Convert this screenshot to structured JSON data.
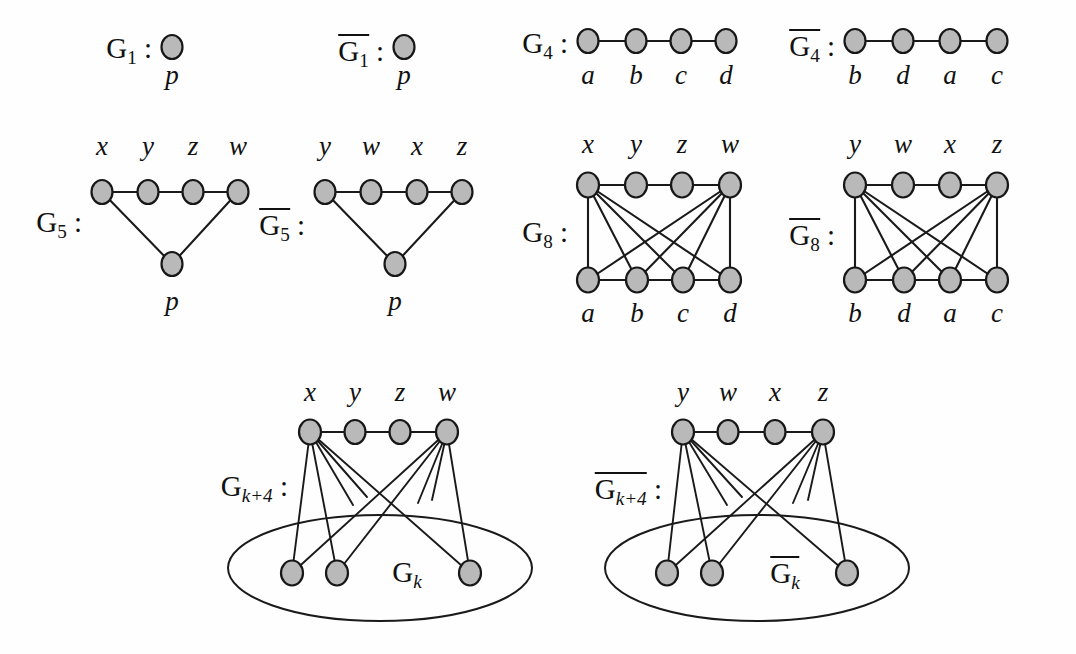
{
  "figure": {
    "background_color": "#fefefe",
    "node_fill": "#b9b9b9",
    "node_stroke": "#171717",
    "edge_color": "#1a1a1a"
  },
  "panels": {
    "g1": {
      "name": "G",
      "subscript": "1",
      "colon": ":",
      "overline": false,
      "vertices": [
        {
          "id": "p",
          "label": "p"
        }
      ]
    },
    "g1_bar": {
      "name": "G",
      "subscript": "1",
      "colon": ":",
      "overline": true,
      "vertices": [
        {
          "id": "p",
          "label": "p"
        }
      ]
    },
    "g4": {
      "name": "G",
      "subscript": "4",
      "colon": ":",
      "overline": false,
      "vertices": [
        {
          "id": "a",
          "label": "a"
        },
        {
          "id": "b",
          "label": "b"
        },
        {
          "id": "c",
          "label": "c"
        },
        {
          "id": "d",
          "label": "d"
        }
      ],
      "edges": [
        [
          "a",
          "b"
        ],
        [
          "b",
          "c"
        ],
        [
          "c",
          "d"
        ]
      ]
    },
    "g4_bar": {
      "name": "G",
      "subscript": "4",
      "colon": ":",
      "overline": true,
      "vertices": [
        {
          "id": "b",
          "label": "b"
        },
        {
          "id": "d",
          "label": "d"
        },
        {
          "id": "a",
          "label": "a"
        },
        {
          "id": "c",
          "label": "c"
        }
      ],
      "edges": [
        [
          "b",
          "d"
        ],
        [
          "d",
          "a"
        ],
        [
          "a",
          "c"
        ]
      ]
    },
    "g5": {
      "name": "G",
      "subscript": "5",
      "colon": ":",
      "overline": false,
      "top_vertices": [
        {
          "id": "x",
          "label": "x"
        },
        {
          "id": "y",
          "label": "y"
        },
        {
          "id": "z",
          "label": "z"
        },
        {
          "id": "w",
          "label": "w"
        }
      ],
      "apex": {
        "id": "p",
        "label": "p"
      },
      "edges": [
        [
          "x",
          "y"
        ],
        [
          "y",
          "z"
        ],
        [
          "z",
          "w"
        ],
        [
          "x",
          "p"
        ],
        [
          "w",
          "p"
        ]
      ]
    },
    "g5_bar": {
      "name": "G",
      "subscript": "5",
      "colon": ":",
      "overline": true,
      "top_vertices": [
        {
          "id": "y",
          "label": "y"
        },
        {
          "id": "w",
          "label": "w"
        },
        {
          "id": "x",
          "label": "x"
        },
        {
          "id": "z",
          "label": "z"
        }
      ],
      "apex": {
        "id": "p",
        "label": "p"
      },
      "edges": [
        [
          "y",
          "w"
        ],
        [
          "w",
          "x"
        ],
        [
          "x",
          "z"
        ],
        [
          "y",
          "p"
        ],
        [
          "z",
          "p"
        ]
      ]
    },
    "g8": {
      "name": "G",
      "subscript": "8",
      "colon": ":",
      "overline": false,
      "top_vertices": [
        {
          "id": "x",
          "label": "x"
        },
        {
          "id": "y",
          "label": "y"
        },
        {
          "id": "z",
          "label": "z"
        },
        {
          "id": "w",
          "label": "w"
        }
      ],
      "bottom_vertices": [
        {
          "id": "a",
          "label": "a"
        },
        {
          "id": "b",
          "label": "b"
        },
        {
          "id": "c",
          "label": "c"
        },
        {
          "id": "d",
          "label": "d"
        }
      ],
      "top_edges": [
        [
          "x",
          "y"
        ],
        [
          "y",
          "z"
        ],
        [
          "z",
          "w"
        ]
      ],
      "bottom_edges": [
        [
          "a",
          "b"
        ],
        [
          "b",
          "c"
        ],
        [
          "c",
          "d"
        ]
      ],
      "cross_edges": [
        [
          "x",
          "a"
        ],
        [
          "x",
          "b"
        ],
        [
          "x",
          "c"
        ],
        [
          "x",
          "d"
        ],
        [
          "w",
          "a"
        ],
        [
          "w",
          "b"
        ],
        [
          "w",
          "c"
        ],
        [
          "w",
          "d"
        ]
      ]
    },
    "g8_bar": {
      "name": "G",
      "subscript": "8",
      "colon": ":",
      "overline": true,
      "top_vertices": [
        {
          "id": "y",
          "label": "y"
        },
        {
          "id": "w",
          "label": "w"
        },
        {
          "id": "x",
          "label": "x"
        },
        {
          "id": "z",
          "label": "z"
        }
      ],
      "bottom_vertices": [
        {
          "id": "b",
          "label": "b"
        },
        {
          "id": "d",
          "label": "d"
        },
        {
          "id": "a",
          "label": "a"
        },
        {
          "id": "c",
          "label": "c"
        }
      ],
      "top_edges": [
        [
          "y",
          "w"
        ],
        [
          "w",
          "x"
        ],
        [
          "x",
          "z"
        ]
      ],
      "bottom_edges": [
        [
          "b",
          "d"
        ],
        [
          "d",
          "a"
        ],
        [
          "a",
          "c"
        ]
      ],
      "cross_edges": [
        [
          "y",
          "b"
        ],
        [
          "y",
          "d"
        ],
        [
          "y",
          "a"
        ],
        [
          "y",
          "c"
        ],
        [
          "z",
          "b"
        ],
        [
          "z",
          "d"
        ],
        [
          "z",
          "a"
        ],
        [
          "z",
          "c"
        ]
      ]
    },
    "gk4": {
      "name": "G",
      "subscript": "k+4",
      "colon": ":",
      "overline": false,
      "top_vertices": [
        {
          "id": "x",
          "label": "x"
        },
        {
          "id": "y",
          "label": "y"
        },
        {
          "id": "z",
          "label": "z"
        },
        {
          "id": "w",
          "label": "w"
        }
      ],
      "top_edges": [
        [
          "x",
          "y"
        ],
        [
          "y",
          "z"
        ],
        [
          "z",
          "w"
        ]
      ],
      "blob": {
        "name": "G",
        "subscript": "k",
        "overline": false
      },
      "inner_vertices": 3,
      "note": "x and w each join to every vertex of G_k"
    },
    "gk4_bar": {
      "name": "G",
      "subscript": "k+4",
      "colon": ":",
      "overline": true,
      "top_vertices": [
        {
          "id": "y",
          "label": "y"
        },
        {
          "id": "w",
          "label": "w"
        },
        {
          "id": "x",
          "label": "x"
        },
        {
          "id": "z",
          "label": "z"
        }
      ],
      "top_edges": [
        [
          "y",
          "w"
        ],
        [
          "w",
          "x"
        ],
        [
          "x",
          "z"
        ]
      ],
      "blob": {
        "name": "G",
        "subscript": "k",
        "overline": true
      },
      "inner_vertices": 3,
      "note": "y and z each join to every vertex of G_k complement"
    }
  }
}
